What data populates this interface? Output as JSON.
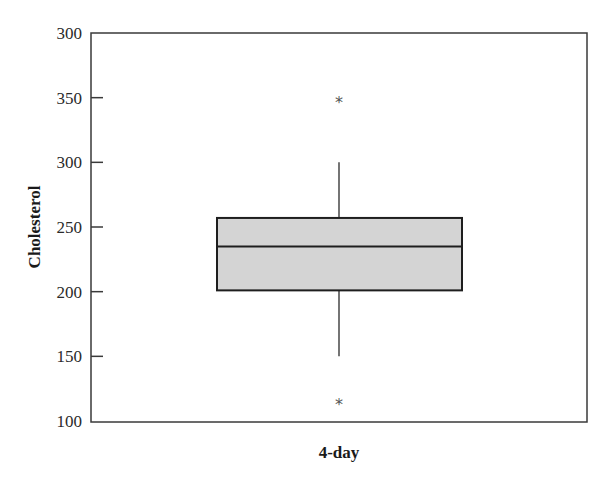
{
  "chart_data": {
    "type": "boxplot",
    "title": "",
    "xlabel": "4-day",
    "ylabel": "Cholesterol",
    "categories": [
      "4-day"
    ],
    "y_tick_labels": [
      "300",
      "350",
      "300",
      "250",
      "200",
      "150",
      "100"
    ],
    "y_tick_values": [
      400,
      350,
      300,
      250,
      200,
      150,
      100
    ],
    "ylim": [
      100,
      400
    ],
    "grid": false,
    "legend": null,
    "series": [
      {
        "name": "4-day",
        "whisker_low": 150,
        "q1": 201,
        "median": 235,
        "q3": 257,
        "whisker_high": 300,
        "outliers": [
          348,
          115
        ]
      }
    ],
    "outlier_marker": "*",
    "box_fill": "#d4d4d4",
    "line_color": "#2a2a2a"
  }
}
